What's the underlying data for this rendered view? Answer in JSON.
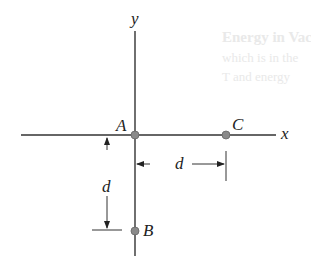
{
  "figure": {
    "axes": {
      "x_label": "x",
      "y_label": "y"
    },
    "points": [
      {
        "name": "A",
        "label": "A"
      },
      {
        "name": "B",
        "label": "B"
      },
      {
        "name": "C",
        "label": "C"
      }
    ],
    "dimensions": {
      "horizontal": {
        "label": "d"
      },
      "vertical": {
        "label": "d"
      }
    },
    "colors": {
      "line": "#333333",
      "point": "#8a8a8a"
    },
    "background_bleed": [
      "Energy in Vacuum",
      "which is in the",
      "T and energy"
    ]
  }
}
